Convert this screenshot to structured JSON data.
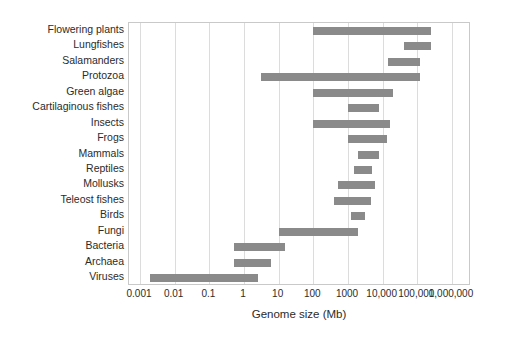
{
  "chart_data": {
    "type": "bar",
    "orientation": "horizontal",
    "bar_style": "range",
    "title": "",
    "xlabel": "Genome size (Mb)",
    "ylabel": "",
    "xscale": "log",
    "xlim": [
      0.001,
      1000000
    ],
    "grid": true,
    "legend": null,
    "xticks": [
      0.001,
      0.01,
      0.1,
      1,
      10,
      100,
      1000,
      10000,
      100000,
      1000000
    ],
    "xticklabels": [
      "0.001",
      "0.01",
      "0.1",
      "1",
      "10",
      "100",
      "1000",
      "10,000",
      "100,000",
      "1,000,000"
    ],
    "categories": [
      "Flowering plants",
      "Lungfishes",
      "Salamanders",
      "Protozoa",
      "Green algae",
      "Cartilaginous fishes",
      "Insects",
      "Frogs",
      "Mammals",
      "Reptiles",
      "Mollusks",
      "Teleost fishes",
      "Birds",
      "Fungi",
      "Bacteria",
      "Archaea",
      "Viruses"
    ],
    "ranges": [
      [
        100,
        250000
      ],
      [
        40000,
        250000
      ],
      [
        14000,
        120000
      ],
      [
        3,
        120000
      ],
      [
        100,
        20000
      ],
      [
        1000,
        8000
      ],
      [
        100,
        16000
      ],
      [
        1000,
        13000
      ],
      [
        2000,
        8000
      ],
      [
        1500,
        5000
      ],
      [
        500,
        6000
      ],
      [
        400,
        4500
      ],
      [
        1200,
        3000
      ],
      [
        10,
        2000
      ],
      [
        0.5,
        15
      ],
      [
        0.5,
        6
      ],
      [
        0.002,
        2.5
      ]
    ],
    "units": "Mb",
    "bar_color": "#8a8a8a",
    "grid_color": "#dcdcdc",
    "frame_color": "#c9c9c9",
    "background_color": "#ffffff"
  }
}
